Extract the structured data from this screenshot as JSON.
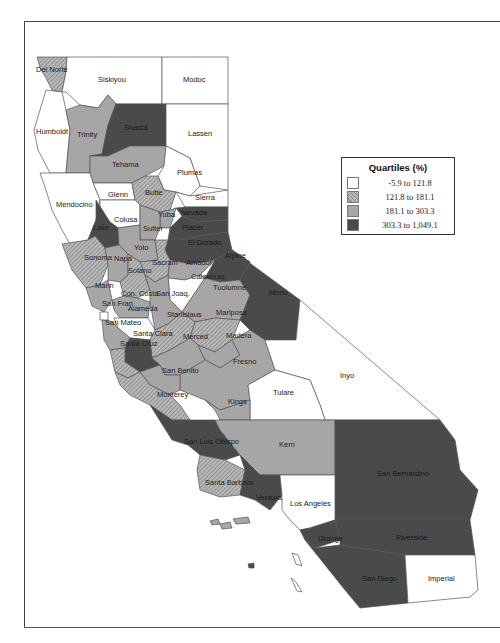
{
  "legend": {
    "title": "Quartiles (%)",
    "items": [
      {
        "range": "-5.9 to 121.8",
        "class": "q1",
        "color": "#ffffff"
      },
      {
        "range": "121.8 to 181.1",
        "class": "q2",
        "color": "#a0a0a0 hatched"
      },
      {
        "range": "181.1 to 303.3",
        "class": "q3",
        "color": "#a6a6a6"
      },
      {
        "range": "303.3 to 1,049.1",
        "class": "q4",
        "color": "#4a4a4a"
      }
    ]
  },
  "counties": {
    "del_norte": {
      "label": "Del Norte",
      "quartile": 2
    },
    "siskiyou": {
      "label": "Siskiyou",
      "quartile": 1
    },
    "modoc": {
      "label": "Modoc",
      "quartile": 1
    },
    "humboldt": {
      "label": "Humboldt",
      "quartile": 1
    },
    "trinity": {
      "label": "Trinity",
      "quartile": 3
    },
    "shasta": {
      "label": "Shasta",
      "quartile": 4
    },
    "lassen": {
      "label": "Lassen",
      "quartile": 1
    },
    "tehama": {
      "label": "Tehama",
      "quartile": 3
    },
    "plumas": {
      "label": "Plumas",
      "quartile": 1
    },
    "glenn": {
      "label": "Glenn",
      "quartile": 1
    },
    "butte": {
      "label": "Butte",
      "quartile": 2
    },
    "sierra": {
      "label": "Sierra",
      "quartile": 1
    },
    "mendocino": {
      "label": "Mendocino",
      "quartile": 1
    },
    "colusa": {
      "label": "Colusa",
      "quartile": 1
    },
    "lake": {
      "label": "Lake",
      "quartile": 4
    },
    "yuba": {
      "label": "Yuba",
      "quartile": 3
    },
    "nevada": {
      "label": "Nevada",
      "quartile": 4
    },
    "sutter": {
      "label": "Sutter",
      "quartile": 3
    },
    "placer": {
      "label": "Placer",
      "quartile": 4
    },
    "el_dorado": {
      "label": "El Dorado",
      "quartile": 4
    },
    "yolo": {
      "label": "Yolo",
      "quartile": 3
    },
    "sonoma": {
      "label": "Sonoma",
      "quartile": 2
    },
    "napa": {
      "label": "Napa",
      "quartile": 3
    },
    "sacramento": {
      "label": "Sacram",
      "quartile": 2
    },
    "amador": {
      "label": "Amador",
      "quartile": 3
    },
    "alpine": {
      "label": "Alpine",
      "quartile": 4
    },
    "solano": {
      "label": "Solano",
      "quartile": 2
    },
    "marin": {
      "label": "Marin",
      "quartile": 3
    },
    "calaveras": {
      "label": "Calaveras",
      "quartile": 1
    },
    "tuolumne": {
      "label": "Tuolumne",
      "quartile": 3
    },
    "mono": {
      "label": "Mono",
      "quartile": 4
    },
    "contra_costa": {
      "label": "Con. Costa",
      "quartile": 3
    },
    "san_joaquin": {
      "label": "San Joaq.",
      "quartile": 3
    },
    "san_francisco": {
      "label": "San Fran",
      "quartile": 1
    },
    "alameda": {
      "label": "Alameda",
      "quartile": 1
    },
    "stanislaus": {
      "label": "Stanislaus",
      "quartile": 2
    },
    "mariposa": {
      "label": "Mariposa",
      "quartile": 2
    },
    "san_mateo": {
      "label": "San Mateo",
      "quartile": 3
    },
    "santa_clara": {
      "label": "Santa Clara",
      "quartile": 4
    },
    "merced": {
      "label": "Merced",
      "quartile": 3
    },
    "madera": {
      "label": "Madera",
      "quartile": 3
    },
    "santa_cruz": {
      "label": "Santa Cruz",
      "quartile": 2
    },
    "fresno": {
      "label": "Fresno",
      "quartile": 3
    },
    "inyo": {
      "label": "Inyo",
      "quartile": 1
    },
    "san_benito": {
      "label": "San Benito",
      "quartile": 3
    },
    "tulare": {
      "label": "Tulare",
      "quartile": 1
    },
    "monterey": {
      "label": "Monterey",
      "quartile": 2
    },
    "kings": {
      "label": "Kings",
      "quartile": 3
    },
    "san_luis_obispo": {
      "label": "San Luis Obispo",
      "quartile": 4
    },
    "kern": {
      "label": "Kern",
      "quartile": 3
    },
    "san_bernardino": {
      "label": "San Bernardino",
      "quartile": 4
    },
    "santa_barbara": {
      "label": "Santa Barbara",
      "quartile": 2
    },
    "ventura": {
      "label": "Ventura",
      "quartile": 4
    },
    "los_angeles": {
      "label": "Los Angeles",
      "quartile": 1
    },
    "orange": {
      "label": "Orange",
      "quartile": 4
    },
    "riverside": {
      "label": "Riverside",
      "quartile": 4
    },
    "san_diego": {
      "label": "San Diego",
      "quartile": 4
    },
    "imperial": {
      "label": "Imperial",
      "quartile": 1
    }
  }
}
